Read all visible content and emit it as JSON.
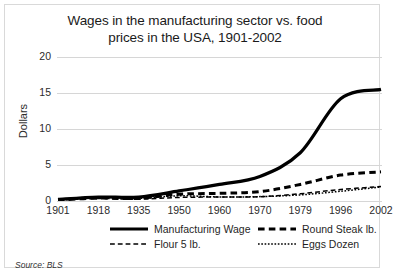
{
  "chart_data": {
    "type": "line",
    "title": "Wages in the manufacturing sector vs. food prices in the USA, 1901-2002",
    "title_line1": "Wages in the manufacturing sector vs. food",
    "title_line2": "prices in the USA, 1901-2002",
    "xlabel": "",
    "ylabel": "Dollars",
    "ylim": [
      0,
      20
    ],
    "yticks": [
      0,
      5,
      10,
      15,
      20
    ],
    "ytick_labels": [
      "0",
      "5",
      "10",
      "15",
      "20"
    ],
    "grid": true,
    "legend_position": "bottom",
    "categories": [
      "1901",
      "1918",
      "1935",
      "1950",
      "1960",
      "1970",
      "1979",
      "1996",
      "2002"
    ],
    "series": [
      {
        "name": "Manufacturing Wage",
        "style": "solid",
        "color": "#000000",
        "width": 3.2,
        "values": [
          0.22,
          0.55,
          0.55,
          1.4,
          2.3,
          3.4,
          6.7,
          14.2,
          15.5
        ]
      },
      {
        "name": "Round Steak lb.",
        "style": "dashed",
        "color": "#000000",
        "width": 3.0,
        "values": [
          0.13,
          0.4,
          0.36,
          0.94,
          1.06,
          1.3,
          2.3,
          3.6,
          4.05
        ]
      },
      {
        "name": "Flour 5 lb.",
        "style": "dash-dot",
        "color": "#000000",
        "width": 1.5,
        "values": [
          0.13,
          0.35,
          0.25,
          0.5,
          0.55,
          0.6,
          1.0,
          1.6,
          2.0
        ]
      },
      {
        "name": "Eggs Dozen",
        "style": "dotted",
        "color": "#000000",
        "width": 1.5,
        "values": [
          0.22,
          0.57,
          0.37,
          0.72,
          0.57,
          0.61,
          0.85,
          1.35,
          1.95
        ]
      }
    ],
    "source": "Source: BLS"
  },
  "legend": {
    "items": [
      {
        "label": "Manufacturing Wage",
        "style": "solid"
      },
      {
        "label": "Round Steak lb.",
        "style": "dashed"
      },
      {
        "label": "Flour 5 lb.",
        "style": "dash-dot"
      },
      {
        "label": "Eggs Dozen",
        "style": "dotted"
      }
    ]
  },
  "colors": {
    "background": "#ffffff",
    "border": "#d9d9d9",
    "gridline": "#d6d6d6",
    "line": "#000000",
    "text": "#1a1a1a"
  }
}
